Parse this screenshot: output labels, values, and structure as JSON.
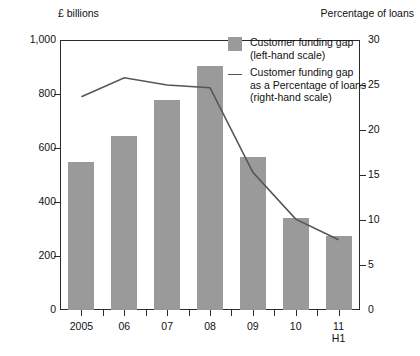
{
  "chart_data": {
    "type": "bar",
    "title": "",
    "categories": [
      "2005",
      "06",
      "07",
      "08",
      "09",
      "10",
      "11\nH1"
    ],
    "xlabel": "",
    "left_axis": {
      "label": "£ billions",
      "ylim": [
        0,
        1000
      ],
      "ticks": [
        0,
        200,
        400,
        600,
        800,
        1000
      ],
      "tick_labels": [
        "0",
        "200",
        "400",
        "600",
        "800",
        "1,000"
      ]
    },
    "right_axis": {
      "label": "Percentage of loans",
      "ylim": [
        0,
        30
      ],
      "ticks": [
        0,
        5,
        10,
        15,
        20,
        25,
        30
      ],
      "tick_labels": [
        "0",
        "5",
        "10",
        "15",
        "20",
        "25",
        "30"
      ]
    },
    "grid": false,
    "legend_position": "top-right",
    "series": [
      {
        "name": "Customer funding gap (left-hand scale)",
        "type": "bar",
        "axis": "left",
        "color": "#9a9a9a",
        "values": [
          548,
          645,
          778,
          902,
          568,
          340,
          275
        ]
      },
      {
        "name": "Customer funding gap as a Percentage of loans (right-hand scale)",
        "type": "line",
        "axis": "right",
        "color": "#555555",
        "values": [
          23.7,
          25.8,
          25.0,
          24.7,
          15.3,
          10.1,
          7.8
        ]
      }
    ]
  },
  "axis_titles": {
    "left": "£ billions",
    "right": "Percentage of loans"
  },
  "legend": {
    "items": [
      {
        "marker": "bar-swatch",
        "line1": "Customer funding gap",
        "line2": "(left-hand scale)",
        "line3": ""
      },
      {
        "marker": "line-swatch",
        "line1": "Customer funding gap",
        "line2": "as a Percentage of loans",
        "line3": "(right-hand scale)"
      }
    ]
  },
  "x_labels": [
    {
      "primary": "2005",
      "secondary": ""
    },
    {
      "primary": "06",
      "secondary": ""
    },
    {
      "primary": "07",
      "secondary": ""
    },
    {
      "primary": "08",
      "secondary": ""
    },
    {
      "primary": "09",
      "secondary": ""
    },
    {
      "primary": "10",
      "secondary": ""
    },
    {
      "primary": "11",
      "secondary": "H1"
    }
  ]
}
